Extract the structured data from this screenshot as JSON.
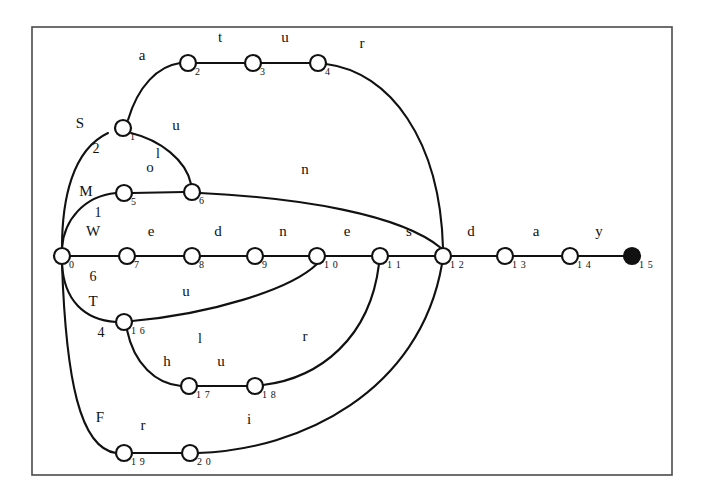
{
  "figure": {
    "name": "word-trie-diagram",
    "type": "trie-graph",
    "frame": {
      "x": 32,
      "y": 27,
      "width": 640,
      "height": 448
    },
    "colors": {
      "ink": "#111111",
      "frame": "#4a4a4a",
      "background": "#ffffff",
      "node_fill": "#ffffff",
      "final_node_fill": "#111111"
    }
  },
  "nodes": [
    {
      "id": "0",
      "index": "0",
      "x": 62,
      "y": 256,
      "final": false
    },
    {
      "id": "1",
      "index": "1",
      "x": 123,
      "y": 128,
      "final": false
    },
    {
      "id": "2",
      "index": "2",
      "x": 188,
      "y": 63,
      "final": false
    },
    {
      "id": "3",
      "index": "3",
      "x": 253,
      "y": 63,
      "final": false
    },
    {
      "id": "4",
      "index": "4",
      "x": 318,
      "y": 63,
      "final": false
    },
    {
      "id": "5",
      "index": "5",
      "x": 124,
      "y": 193,
      "final": false
    },
    {
      "id": "6",
      "index": "6",
      "x": 192,
      "y": 192,
      "final": false
    },
    {
      "id": "7",
      "index": "7",
      "x": 127,
      "y": 256,
      "final": false
    },
    {
      "id": "8",
      "index": "8",
      "x": 192,
      "y": 256,
      "final": false
    },
    {
      "id": "9",
      "index": "9",
      "x": 255,
      "y": 256,
      "final": false
    },
    {
      "id": "10",
      "index": "1 0",
      "x": 317,
      "y": 256,
      "final": false
    },
    {
      "id": "11",
      "index": "1 1",
      "x": 380,
      "y": 256,
      "final": false
    },
    {
      "id": "12",
      "index": "1 2",
      "x": 443,
      "y": 256,
      "final": false
    },
    {
      "id": "13",
      "index": "1 3",
      "x": 505,
      "y": 256,
      "final": false
    },
    {
      "id": "14",
      "index": "1 4",
      "x": 570,
      "y": 256,
      "final": false
    },
    {
      "id": "15",
      "index": "1 5",
      "x": 632,
      "y": 256,
      "final": true
    },
    {
      "id": "16",
      "index": "1 6",
      "x": 124,
      "y": 322,
      "final": false
    },
    {
      "id": "17",
      "index": "1 7",
      "x": 189,
      "y": 386,
      "final": false
    },
    {
      "id": "18",
      "index": "1 8",
      "x": 255,
      "y": 386,
      "final": false
    },
    {
      "id": "19",
      "index": "1 9",
      "x": 124,
      "y": 453,
      "final": false
    },
    {
      "id": "20",
      "index": "2 0",
      "x": 190,
      "y": 453,
      "final": false
    }
  ],
  "edges": [
    {
      "from": "0",
      "to": "1",
      "label": "S",
      "sub": "2",
      "path": "M 62,248 C 62,200 72,150 108,133",
      "label_x": 80,
      "label_y": 128,
      "sub_x": 96,
      "sub_y": 153
    },
    {
      "from": "1",
      "to": "2",
      "label": "a",
      "sub": "",
      "path": "M 128,120 C 138,86 158,66 180,63",
      "label_x": 142,
      "label_y": 60,
      "sub_x": 0,
      "sub_y": 0
    },
    {
      "from": "2",
      "to": "3",
      "label": "t",
      "sub": "",
      "path": "M 196,63 L 245,63",
      "label_x": 220,
      "label_y": 42,
      "sub_x": 0,
      "sub_y": 0
    },
    {
      "from": "3",
      "to": "4",
      "label": "u",
      "sub": "",
      "path": "M 261,63 L 310,63",
      "label_x": 285,
      "label_y": 42,
      "sub_x": 0,
      "sub_y": 0
    },
    {
      "from": "4",
      "to": "12",
      "label": "r",
      "sub": "",
      "path": "M 326,64 C 390,72 440,140 443,248",
      "label_x": 362,
      "label_y": 48,
      "sub_x": 0,
      "sub_y": 0
    },
    {
      "from": "1",
      "to": "6",
      "label": "u",
      "sub": "l",
      "path": "M 131,133 C 160,140 186,160 191,184",
      "label_x": 176,
      "label_y": 130,
      "sub_x": 158,
      "sub_y": 158
    },
    {
      "from": "0",
      "to": "5",
      "label": "M",
      "sub": "1",
      "path": "M 62,248 C 64,220 84,196 116,193",
      "label_x": 86,
      "label_y": 196,
      "sub_x": 98,
      "sub_y": 217
    },
    {
      "from": "5",
      "to": "6",
      "label": "o",
      "sub": "",
      "path": "M 132,193 L 184,192",
      "label_x": 150,
      "label_y": 172,
      "sub_x": 0,
      "sub_y": 0
    },
    {
      "from": "6",
      "to": "12",
      "label": "n",
      "sub": "",
      "path": "M 200,193 C 300,198 400,214 441,248",
      "label_x": 305,
      "label_y": 174,
      "sub_x": 0,
      "sub_y": 0
    },
    {
      "from": "0",
      "to": "7",
      "label": "W",
      "sub": "6",
      "path": "M 70,256 L 119,256",
      "label_x": 93,
      "label_y": 236,
      "sub_x": 93,
      "sub_y": 281
    },
    {
      "from": "7",
      "to": "8",
      "label": "e",
      "sub": "",
      "path": "M 135,256 L 184,256",
      "label_x": 151,
      "label_y": 236,
      "sub_x": 0,
      "sub_y": 0
    },
    {
      "from": "8",
      "to": "9",
      "label": "d",
      "sub": "",
      "path": "M 200,256 L 247,256",
      "label_x": 218,
      "label_y": 236,
      "sub_x": 0,
      "sub_y": 0
    },
    {
      "from": "9",
      "to": "10",
      "label": "n",
      "sub": "",
      "path": "M 263,256 L 309,256",
      "label_x": 283,
      "label_y": 236,
      "sub_x": 0,
      "sub_y": 0
    },
    {
      "from": "10",
      "to": "11",
      "label": "e",
      "sub": "",
      "path": "M 325,256 L 372,256",
      "label_x": 347,
      "label_y": 236,
      "sub_x": 0,
      "sub_y": 0
    },
    {
      "from": "11",
      "to": "12",
      "label": "s",
      "sub": "",
      "path": "M 388,256 L 435,256",
      "label_x": 409,
      "label_y": 236,
      "sub_x": 0,
      "sub_y": 0
    },
    {
      "from": "12",
      "to": "13",
      "label": "d",
      "sub": "",
      "path": "M 451,256 L 497,256",
      "label_x": 471,
      "label_y": 236,
      "sub_x": 0,
      "sub_y": 0
    },
    {
      "from": "13",
      "to": "14",
      "label": "a",
      "sub": "",
      "path": "M 513,256 L 562,256",
      "label_x": 536,
      "label_y": 236,
      "sub_x": 0,
      "sub_y": 0
    },
    {
      "from": "14",
      "to": "15",
      "label": "y",
      "sub": "",
      "path": "M 578,256 L 625,256",
      "label_x": 599,
      "label_y": 236,
      "sub_x": 0,
      "sub_y": 0
    },
    {
      "from": "0",
      "to": "16",
      "label": "T",
      "sub": "4",
      "path": "M 62,264 C 64,300 84,320 116,322",
      "label_x": 93,
      "label_y": 306,
      "sub_x": 101,
      "sub_y": 337
    },
    {
      "from": "16",
      "to": "10",
      "label": "u",
      "sub": "l",
      "path": "M 132,321 C 210,314 290,290 317,264",
      "label_x": 186,
      "label_y": 296,
      "sub_x": 200,
      "sub_y": 343
    },
    {
      "from": "16",
      "to": "17",
      "label": "h",
      "sub": "",
      "path": "M 127,330 C 134,364 156,384 181,386",
      "label_x": 167,
      "label_y": 366,
      "sub_x": 0,
      "sub_y": 0
    },
    {
      "from": "17",
      "to": "18",
      "label": "u",
      "sub": "",
      "path": "M 197,386 L 247,386",
      "label_x": 221,
      "label_y": 366,
      "sub_x": 0,
      "sub_y": 0
    },
    {
      "from": "18",
      "to": "11",
      "label": "r",
      "sub": "",
      "path": "M 263,385 C 320,378 370,338 379,264",
      "label_x": 305,
      "label_y": 341,
      "sub_x": 0,
      "sub_y": 0
    },
    {
      "from": "0",
      "to": "19",
      "label": "F",
      "sub": "",
      "path": "M 62,264 C 66,380 80,448 116,453",
      "label_x": 100,
      "label_y": 422,
      "sub_x": 0,
      "sub_y": 0
    },
    {
      "from": "19",
      "to": "20",
      "label": "r",
      "sub": "",
      "path": "M 132,453 L 182,453",
      "label_x": 143,
      "label_y": 430,
      "sub_x": 0,
      "sub_y": 0
    },
    {
      "from": "20",
      "to": "12",
      "label": "i",
      "sub": "",
      "path": "M 198,453 C 300,450 420,392 442,264",
      "label_x": 249,
      "label_y": 424,
      "sub_x": 0,
      "sub_y": 0
    }
  ]
}
